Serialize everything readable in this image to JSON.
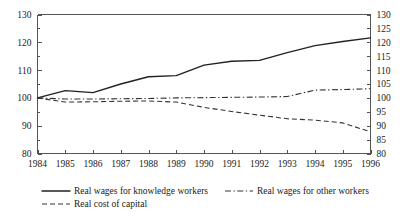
{
  "chart_data": {
    "type": "line",
    "title": "",
    "subtitle": "",
    "xlabel": "",
    "ylabel": "",
    "x": [
      1984,
      1985,
      1986,
      1987,
      1988,
      1989,
      1990,
      1991,
      1992,
      1993,
      1994,
      1995,
      1996
    ],
    "categories": [
      "1984",
      "1985",
      "1986",
      "1987",
      "1988",
      "1989",
      "1990",
      "1991",
      "1992",
      "1993",
      "1994",
      "1995",
      "1996"
    ],
    "series": [
      {
        "name": "Real wages for knowledge workers",
        "style": "solid",
        "values": [
          100.0,
          102.6,
          101.9,
          105.0,
          107.6,
          108.0,
          111.8,
          113.2,
          113.5,
          116.3,
          118.8,
          120.3,
          121.6
        ]
      },
      {
        "name": "Real wages for other workers",
        "style": "dash-dot",
        "values": [
          100.0,
          99.6,
          99.6,
          99.7,
          99.8,
          100.0,
          100.1,
          100.2,
          100.3,
          100.5,
          102.8,
          103.0,
          103.3
        ]
      },
      {
        "name": "Real cost of capital",
        "style": "dashed",
        "values": [
          100.0,
          98.5,
          98.6,
          98.8,
          98.9,
          98.5,
          96.6,
          95.1,
          93.8,
          92.5,
          92.0,
          91.0,
          87.8
        ]
      }
    ],
    "left_axis": {
      "min": 80,
      "max": 130,
      "tick_step": 10,
      "ticks": [
        80,
        90,
        100,
        110,
        120,
        130
      ],
      "minor_tick_step": 5
    },
    "right_axis": {
      "min": 80,
      "max": 130,
      "tick_step": 5,
      "ticks": [
        80,
        85,
        90,
        95,
        100,
        105,
        110,
        115,
        120,
        125,
        130
      ]
    },
    "grid": false,
    "legend_position": "bottom",
    "legend": [
      {
        "label": "Real wages for knowledge workers",
        "style": "solid"
      },
      {
        "label": "Real wages for other workers",
        "style": "dash-dot"
      },
      {
        "label": "Real cost of capital",
        "style": "dashed"
      }
    ]
  },
  "colors": {
    "background": "#ffffff",
    "axis": "#555555",
    "series_solid": "#222222",
    "series_dashdot": "#333333",
    "series_dashed": "#333333",
    "text": "#1a1a1a"
  }
}
